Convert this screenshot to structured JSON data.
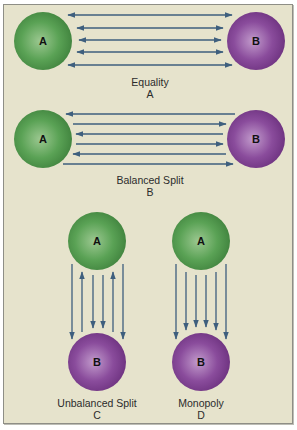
{
  "colors": {
    "background": "#e6e3cc",
    "border": "#8e8e86",
    "node_a": "#4f9a4c",
    "node_b": "#7b3f8e",
    "arrow": "#3e5f7e"
  },
  "nodes": {
    "a_label": "A",
    "b_label": "B"
  },
  "panels": [
    {
      "id": "A",
      "title": "Equality",
      "letter": "A",
      "orientation": "horizontal",
      "arrows": [
        "both",
        "both",
        "both",
        "both",
        "both"
      ]
    },
    {
      "id": "B",
      "title": "Balanced Split",
      "letter": "B",
      "orientation": "horizontal",
      "arrows": [
        "to-A",
        "to-B",
        "to-A",
        "to-B",
        "to-A",
        "to-B"
      ]
    },
    {
      "id": "C",
      "title": "Unbalanced Split",
      "letter": "C",
      "orientation": "vertical",
      "arrows": [
        "to-B",
        "to-A",
        "to-B",
        "to-B",
        "to-A",
        "to-B"
      ]
    },
    {
      "id": "D",
      "title": "Monopoly",
      "letter": "D",
      "orientation": "vertical",
      "arrows": [
        "to-B",
        "to-B",
        "to-B",
        "to-B",
        "to-B",
        "to-B"
      ]
    }
  ]
}
